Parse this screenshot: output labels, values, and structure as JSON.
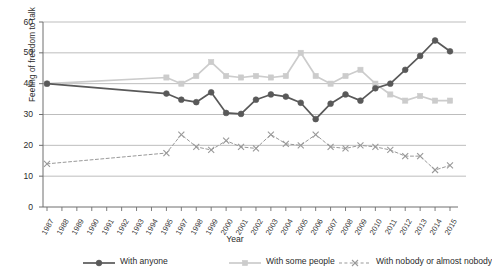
{
  "chart_data": {
    "type": "line",
    "title": "",
    "xlabel": "Year",
    "ylabel": "Feeling of freedom to talk",
    "ylim": [
      0,
      60
    ],
    "yticks": [
      0,
      10,
      20,
      30,
      40,
      50,
      60
    ],
    "grid": "horizontal",
    "legend_position": "bottom",
    "categories": [
      "1987",
      "1988",
      "1989",
      "1990",
      "1991",
      "1992",
      "1993",
      "1994",
      "1995",
      "1997",
      "1998",
      "1999",
      "2000",
      "2001",
      "2002",
      "2003",
      "2004",
      "2005",
      "2006",
      "2007",
      "2008",
      "2009",
      "2010",
      "2011",
      "2012",
      "2013",
      "2014",
      "2015"
    ],
    "series": [
      {
        "name": "With anyone",
        "color": "#595959",
        "marker": "circle",
        "linestyle": "solid",
        "values": [
          40,
          null,
          null,
          null,
          null,
          null,
          null,
          null,
          36.8,
          34.8,
          34,
          37.2,
          30.5,
          30.2,
          34.8,
          36.5,
          35.8,
          33.8,
          28.5,
          33.5,
          36.5,
          34.5,
          38.5,
          40,
          44.5,
          49,
          54,
          50.5
        ]
      },
      {
        "name": "With some people",
        "color": "#cccccc",
        "marker": "square",
        "linestyle": "solid",
        "values": [
          40,
          null,
          null,
          null,
          null,
          null,
          null,
          null,
          42,
          40,
          42.5,
          47,
          42.5,
          42,
          42.5,
          42,
          42.5,
          50,
          42.5,
          40,
          42.5,
          44.5,
          40,
          36.5,
          34.5,
          36,
          34.5,
          34.5
        ]
      },
      {
        "name": "With nobody or almost nobody",
        "color": "#999999",
        "marker": "x",
        "linestyle": "dashed",
        "values": [
          14,
          null,
          null,
          null,
          null,
          null,
          null,
          null,
          17.5,
          23.5,
          19.5,
          18.5,
          21.5,
          19.5,
          19,
          23.5,
          20.5,
          20,
          23.5,
          19.5,
          19,
          20,
          19.5,
          18.5,
          16.5,
          16.5,
          12,
          13.5
        ]
      }
    ]
  },
  "legend": {
    "items": [
      {
        "label": "With anyone"
      },
      {
        "label": "With some people"
      },
      {
        "label": "With nobody or almost nobody"
      }
    ]
  }
}
